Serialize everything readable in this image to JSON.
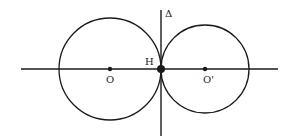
{
  "diagram": {
    "colors": {
      "stroke": "#1a1a1a",
      "background": "#ffffff",
      "text": "#222222"
    },
    "horizontal_line": {
      "x1": 21,
      "y1": 69,
      "x2": 278,
      "y2": 69
    },
    "vertical_line": {
      "x1": 161,
      "y1": 10,
      "x2": 161,
      "y2": 136,
      "label": "Δ"
    },
    "circles": [
      {
        "name": "left-circle",
        "cx": 110,
        "cy": 69,
        "r": 51,
        "center_label": "O"
      },
      {
        "name": "right-circle",
        "cx": 205,
        "cy": 69,
        "r": 44,
        "center_label": "O'"
      }
    ],
    "points": [
      {
        "name": "O",
        "x": 110,
        "y": 69,
        "label": "O"
      },
      {
        "name": "H",
        "x": 161,
        "y": 69,
        "label": "H"
      },
      {
        "name": "O'",
        "x": 205,
        "y": 69,
        "label": "O'"
      }
    ],
    "labels": {
      "delta": "Δ",
      "h": "H",
      "o": "O",
      "o_prime": "O'"
    }
  }
}
